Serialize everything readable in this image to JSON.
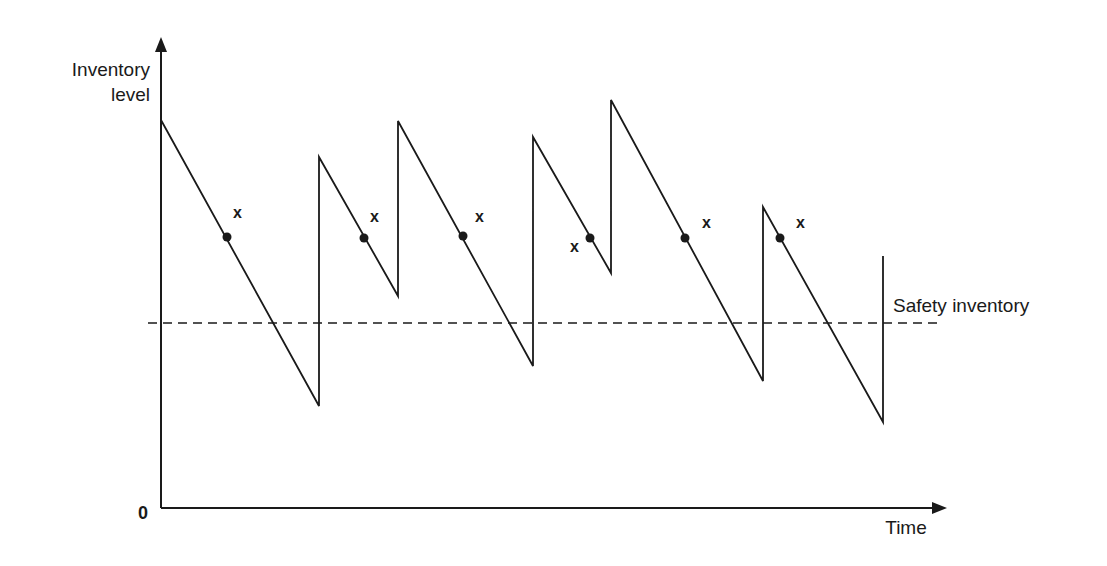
{
  "diagram": {
    "y_axis_label_line1": "Inventory",
    "y_axis_label_line2": "level",
    "x_axis_label": "Time",
    "origin_label": "0",
    "safety_line_label": "Safety inventory",
    "reorder_marker_label": "x",
    "colors": {
      "line": "#1a1a1a",
      "background": "#ffffff"
    }
  },
  "chart_data": {
    "type": "line",
    "title": "",
    "xlabel": "Time",
    "ylabel": "Inventory level",
    "grid": false,
    "annotations": [
      "Safety inventory",
      "x (reorder points)"
    ],
    "sawtooth_pixels": [
      [
        161,
        120
      ],
      [
        319,
        406
      ],
      [
        319,
        157
      ],
      [
        398,
        296
      ],
      [
        398,
        121
      ],
      [
        533,
        366
      ],
      [
        533,
        137
      ],
      [
        611,
        273
      ],
      [
        611,
        100
      ],
      [
        763,
        381
      ],
      [
        763,
        207
      ],
      [
        883,
        422
      ],
      [
        883,
        256
      ]
    ],
    "reorder_points_pixels": [
      [
        227,
        237
      ],
      [
        364,
        238
      ],
      [
        463,
        236
      ],
      [
        590,
        238
      ],
      [
        685,
        238
      ],
      [
        780,
        238
      ]
    ],
    "marker_label_positions": [
      [
        233,
        218
      ],
      [
        370,
        222
      ],
      [
        475,
        222
      ],
      [
        570,
        252
      ],
      [
        702,
        228
      ],
      [
        796,
        228
      ]
    ],
    "safety_inventory_y_pixel": 323
  }
}
